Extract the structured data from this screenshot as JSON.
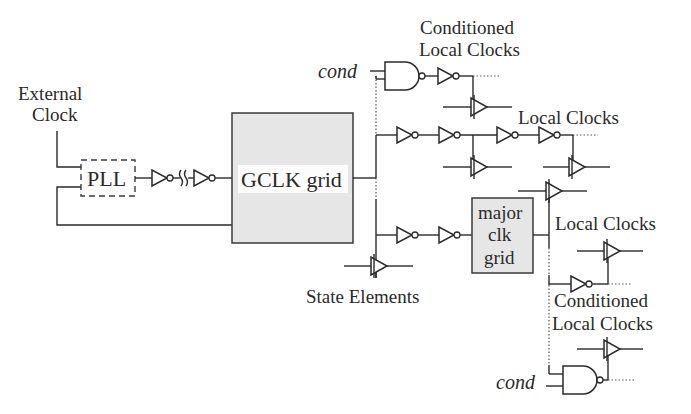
{
  "diagram": {
    "labels": {
      "external_clock_line1": "External",
      "external_clock_line2": "Clock",
      "pll": "PLL",
      "gclk_grid": "GCLK grid",
      "major_clk_grid_line1": "major",
      "major_clk_grid_line2": "clk",
      "major_clk_grid_line3": "grid",
      "conditioned_local_clocks_top_line1": "Conditioned",
      "conditioned_local_clocks_top_line2": "Local Clocks",
      "local_clocks_top": "Local Clocks",
      "local_clocks_bottom": "Local Clocks",
      "conditioned_local_clocks_bottom_line1": "Conditioned",
      "conditioned_local_clocks_bottom_line2": "Local Clocks",
      "state_elements": "State Elements",
      "cond_top": "cond",
      "cond_bottom": "cond"
    },
    "blocks": [
      {
        "name": "PLL",
        "style": "dashed box"
      },
      {
        "name": "GCLK grid",
        "style": "gray filled box"
      },
      {
        "name": "major clk grid",
        "style": "gray filled box"
      }
    ],
    "components": {
      "inverters": 10,
      "buffers": 8,
      "nand_gates": 2
    },
    "colors": {
      "stroke": "#2a2a2a",
      "grid_fill": "#e6e6e6",
      "background": "#ffffff"
    }
  }
}
